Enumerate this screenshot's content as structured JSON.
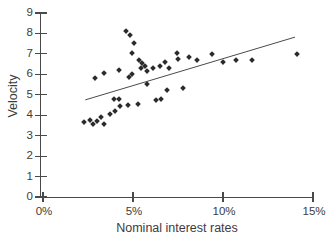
{
  "figure": {
    "background": "#ffffff",
    "ink_color": "#2b2b2b",
    "axis_color": "#4a4a4a",
    "text_color": "#3c3c3c"
  },
  "chart_data": {
    "type": "scatter",
    "title": "",
    "xlabel": "Nominal interest rates",
    "ylabel": "Velocity",
    "xlim": [
      0,
      15
    ],
    "ylim": [
      0,
      9
    ],
    "grid": false,
    "legend": null,
    "marker": "diamond",
    "x_unit": "percent",
    "x_ticks": [
      {
        "value": 0,
        "label": "0%"
      },
      {
        "value": 5,
        "label": "5%"
      },
      {
        "value": 10,
        "label": "10%"
      },
      {
        "value": 15,
        "label": "15%"
      }
    ],
    "y_ticks": [
      {
        "value": 0,
        "label": "0"
      },
      {
        "value": 1,
        "label": "1"
      },
      {
        "value": 2,
        "label": "2"
      },
      {
        "value": 3,
        "label": "3"
      },
      {
        "value": 4,
        "label": "4"
      },
      {
        "value": 5,
        "label": "5"
      },
      {
        "value": 6,
        "label": "6"
      },
      {
        "value": 7,
        "label": "7"
      },
      {
        "value": 8,
        "label": "8"
      },
      {
        "value": 9,
        "label": "9"
      }
    ],
    "points": [
      [
        2.3,
        3.65
      ],
      [
        2.6,
        3.75
      ],
      [
        2.8,
        3.55
      ],
      [
        3.0,
        3.7
      ],
      [
        3.2,
        3.9
      ],
      [
        3.4,
        3.55
      ],
      [
        3.7,
        4.05
      ],
      [
        4.0,
        4.2
      ],
      [
        4.3,
        4.45
      ],
      [
        3.95,
        4.8
      ],
      [
        4.2,
        4.8
      ],
      [
        4.7,
        4.5
      ],
      [
        5.3,
        4.55
      ],
      [
        6.3,
        4.75
      ],
      [
        6.55,
        4.8
      ],
      [
        6.9,
        5.25
      ],
      [
        7.8,
        5.35
      ],
      [
        2.9,
        5.8
      ],
      [
        3.4,
        6.05
      ],
      [
        4.2,
        6.2
      ],
      [
        4.6,
        8.1
      ],
      [
        4.85,
        7.9
      ],
      [
        5.05,
        7.55
      ],
      [
        4.95,
        7.05
      ],
      [
        5.35,
        6.7
      ],
      [
        5.5,
        6.55
      ],
      [
        5.65,
        6.4
      ],
      [
        5.45,
        6.3
      ],
      [
        5.8,
        6.15
      ],
      [
        4.95,
        6.0
      ],
      [
        4.75,
        5.85
      ],
      [
        5.8,
        5.55
      ],
      [
        6.1,
        6.3
      ],
      [
        6.5,
        6.4
      ],
      [
        6.8,
        6.6
      ],
      [
        7.0,
        6.3
      ],
      [
        7.45,
        7.05
      ],
      [
        7.5,
        6.75
      ],
      [
        8.1,
        6.85
      ],
      [
        8.55,
        6.7
      ],
      [
        9.4,
        7.0
      ],
      [
        10.0,
        6.6
      ],
      [
        10.7,
        6.7
      ],
      [
        11.6,
        6.7
      ],
      [
        14.1,
        7.0
      ]
    ],
    "trend_line": {
      "x1": 2.35,
      "y1": 4.75,
      "x2": 14.0,
      "y2": 7.82
    }
  }
}
